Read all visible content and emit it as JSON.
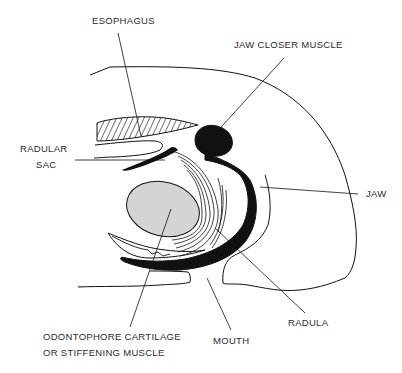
{
  "diagram": {
    "title": "",
    "labels": {
      "esophagus": "ESOPHAGUS",
      "jaw_closer_muscle": "JAW CLOSER MUSCLE",
      "radular_sac_line1": "RADULAR",
      "radular_sac_line2": "SAC",
      "jaw": "JAW",
      "odontophore_line1": "ODONTOPHORE CARTILAGE",
      "odontophore_line2": "OR STIFFENING MUSCLE",
      "mouth": "MOUTH",
      "radula": "RADULA"
    },
    "colors": {
      "ink": "#111111",
      "cartilage_fill": "#d4d4d4",
      "background": "#ffffff"
    }
  }
}
